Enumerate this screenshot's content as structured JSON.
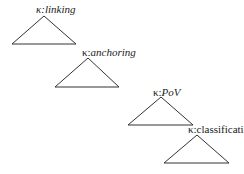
{
  "diagram": {
    "nodes": [
      {
        "kappa": "κ:",
        "name": "linking",
        "italic": true
      },
      {
        "kappa": "κ:",
        "name": "anchoring",
        "italic": true
      },
      {
        "kappa": "κ:",
        "name": "PoV",
        "italic": true
      },
      {
        "kappa": "κ:",
        "name": "classification",
        "italic": false
      }
    ],
    "line_color": "#333333"
  }
}
